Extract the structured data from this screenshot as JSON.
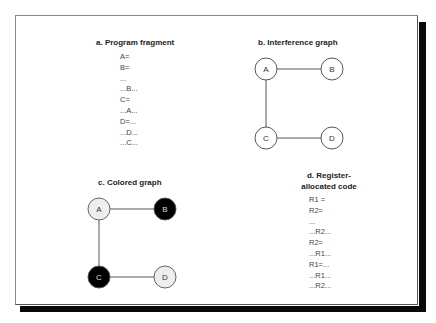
{
  "panels": {
    "a": {
      "title": "a. Program fragment",
      "lines": [
        "A=",
        "B=",
        "...",
        "...B...",
        "C=",
        "...A...",
        "D=...",
        "...D...",
        "...C..."
      ]
    },
    "b": {
      "title": "b. Interference graph",
      "nodes": [
        {
          "label": "A",
          "fill": "#ffffff",
          "text_color": "#333333"
        },
        {
          "label": "B",
          "fill": "#ffffff",
          "text_color": "#333333"
        },
        {
          "label": "C",
          "fill": "#ffffff",
          "text_color": "#333333"
        },
        {
          "label": "D",
          "fill": "#ffffff",
          "text_color": "#333333"
        }
      ],
      "edges": [
        [
          "A",
          "B"
        ],
        [
          "A",
          "C"
        ],
        [
          "C",
          "D"
        ]
      ]
    },
    "c": {
      "title": "c. Colored graph",
      "nodes": [
        {
          "label": "A",
          "fill": "#eeeeee",
          "text_color": "#333333"
        },
        {
          "label": "B",
          "fill": "#000000",
          "text_color": "#dddddd"
        },
        {
          "label": "C",
          "fill": "#000000",
          "text_color": "#dddddd"
        },
        {
          "label": "D",
          "fill": "#eeeeee",
          "text_color": "#333333"
        }
      ],
      "edges": [
        [
          "A",
          "B"
        ],
        [
          "A",
          "C"
        ],
        [
          "C",
          "D"
        ]
      ]
    },
    "d": {
      "title_line1": "d. Register-",
      "title_line2": "allocated code",
      "lines": [
        "R1 =",
        "R2=",
        "...",
        "...R2...",
        "R2=",
        "...R1...",
        "R1=...",
        "...R1...",
        "...R2..."
      ]
    }
  }
}
